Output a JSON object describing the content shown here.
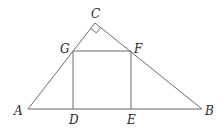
{
  "diagram": {
    "type": "geometry",
    "points": {
      "A": {
        "label": "A",
        "x": 28,
        "y": 109
      },
      "B": {
        "label": "B",
        "x": 202,
        "y": 109
      },
      "C": {
        "label": "C",
        "x": 95,
        "y": 23
      },
      "D": {
        "label": "D",
        "x": 73,
        "y": 109
      },
      "E": {
        "label": "E",
        "x": 131,
        "y": 109
      },
      "F": {
        "label": "F",
        "x": 131,
        "y": 51
      },
      "G": {
        "label": "G",
        "x": 73,
        "y": 51
      }
    },
    "right_angle_at": "C",
    "segments": [
      "AB",
      "AC",
      "CB",
      "DG",
      "GF",
      "FE",
      "DE"
    ],
    "colors": {
      "line": "#6b6b6b",
      "label": "#2a2a2a"
    }
  }
}
